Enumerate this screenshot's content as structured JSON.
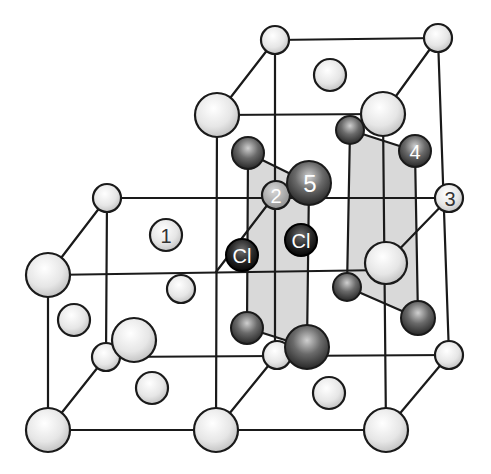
{
  "colors": {
    "line": "#1a1a1a",
    "plane": "#d9d9d9",
    "light_atom": "#eeeeee",
    "dark_atom": "#3a3a3a",
    "label_dark_text": "#ffffff",
    "label_light_text": "#333333"
  },
  "labels": {
    "one": "1",
    "two": "2",
    "three": "3",
    "four": "4",
    "five": "5",
    "cl_a": "Cl",
    "cl_b": "Cl"
  }
}
